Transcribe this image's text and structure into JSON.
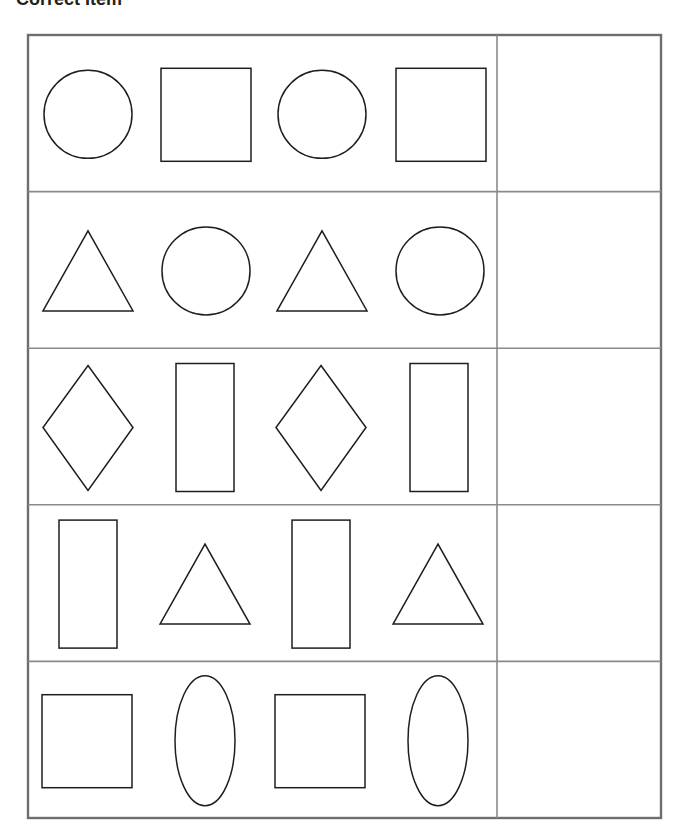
{
  "worksheet": {
    "title": "Correct Item",
    "instructions_visible": false,
    "columns": [
      "pattern",
      "answer"
    ],
    "rows": [
      {
        "pattern": [
          "circle",
          "square",
          "circle",
          "square"
        ],
        "answer": ""
      },
      {
        "pattern": [
          "triangle",
          "circle",
          "triangle",
          "circle"
        ],
        "answer": ""
      },
      {
        "pattern": [
          "diamond",
          "tall-rectangle",
          "diamond",
          "tall-rectangle"
        ],
        "answer": ""
      },
      {
        "pattern": [
          "tall-rectangle",
          "triangle",
          "tall-rectangle",
          "triangle"
        ],
        "answer": ""
      },
      {
        "pattern": [
          "square",
          "oval",
          "square",
          "oval"
        ],
        "answer": ""
      }
    ]
  },
  "colors": {
    "shape_stroke": "#1e1e1e",
    "grid": "#7a7a7a",
    "background": "#ffffff"
  }
}
